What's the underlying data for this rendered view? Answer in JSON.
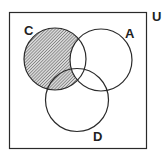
{
  "diagram": {
    "type": "venn",
    "universe_label": "U",
    "sets": [
      {
        "name": "C",
        "label": "C"
      },
      {
        "name": "A",
        "label": "A"
      },
      {
        "name": "D",
        "label": "D"
      }
    ],
    "shaded_region": "C − A",
    "colors": {
      "stroke": "#2a2a2a",
      "hatch": "#555555",
      "background": "#ffffff"
    }
  }
}
